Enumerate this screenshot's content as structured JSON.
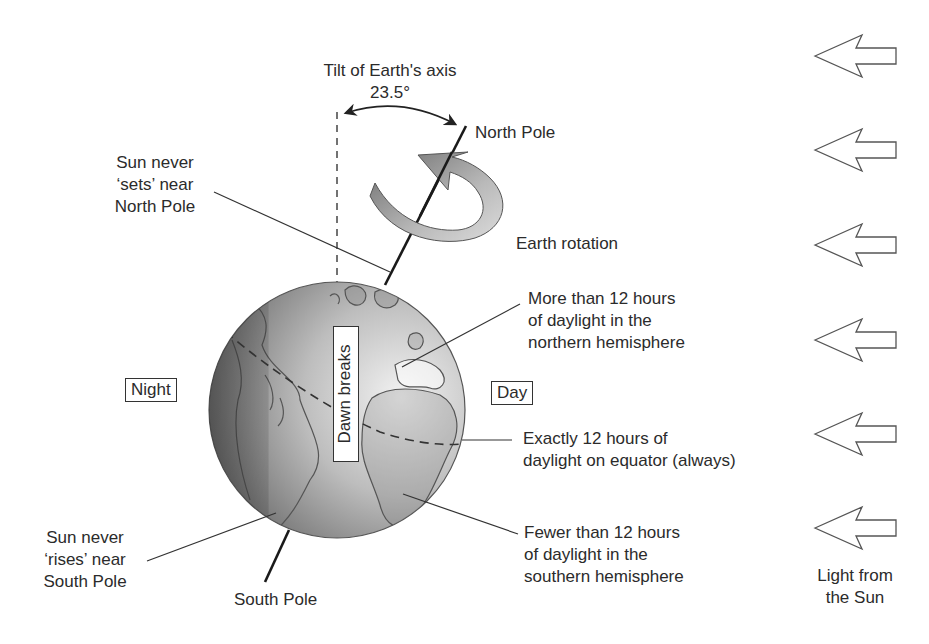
{
  "diagram": {
    "tilt": {
      "title": "Tilt of Earth's axis",
      "angle": "23.5°"
    },
    "poles": {
      "north": "North Pole",
      "south": "South Pole"
    },
    "rotation_label": "Earth rotation",
    "dawn_label": "Dawn breaks",
    "night_label": "Night",
    "day_label": "Day",
    "callouts": {
      "north_sun": [
        "Sun never",
        "‘sets’ near",
        "North Pole"
      ],
      "south_sun": [
        "Sun never",
        "‘rises’ near",
        "South Pole"
      ],
      "northern": [
        "More than 12 hours",
        "of daylight in the",
        "northern hemisphere"
      ],
      "equator": [
        "Exactly 12 hours of",
        "daylight on equator (always)"
      ],
      "southern": [
        "Fewer than 12 hours",
        "of daylight in the",
        "southern hemisphere"
      ]
    },
    "sun_light": {
      "label": [
        "Light from",
        "the Sun"
      ],
      "arrow_count": 6
    }
  }
}
